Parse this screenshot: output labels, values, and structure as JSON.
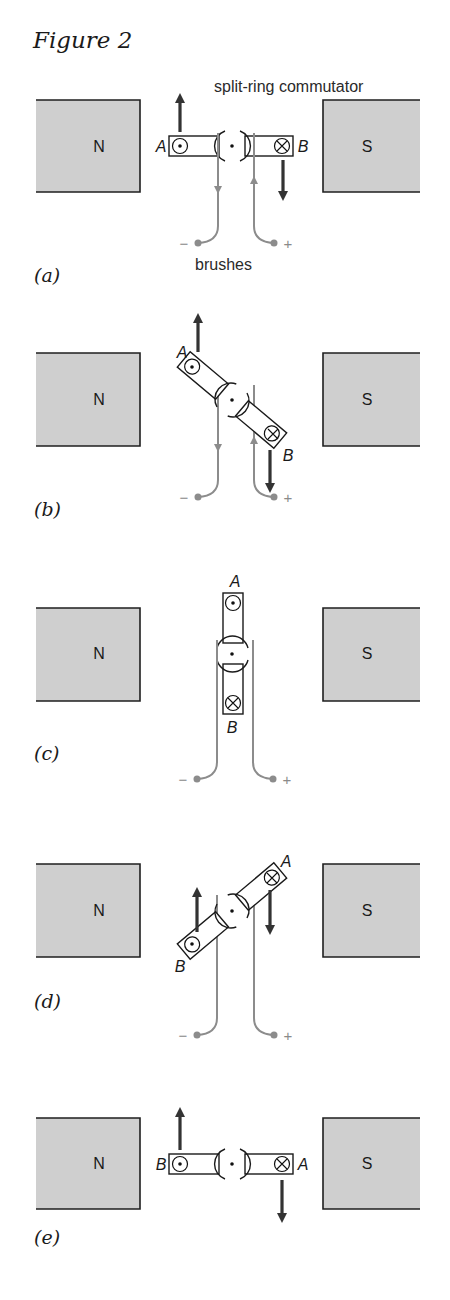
{
  "figure": {
    "title": "Figure 2",
    "annotations": {
      "commutator": "split-ring commutator",
      "brushes": "brushes"
    },
    "colors": {
      "magnet_fill": "#cfcfcf",
      "outline": "#1a1a1a",
      "brush_wire": "#8c8c8c",
      "force_arrow": "#333333"
    },
    "symbols": {
      "current_out": "dot-in-circle (current out of page)",
      "current_in": "cross-in-circle (current into page)"
    },
    "panels": [
      {
        "label": "(a)",
        "north": "N",
        "south": "S",
        "coil_angle_deg": 0,
        "side_left_label": "A",
        "side_right_label": "B",
        "left_current": "out",
        "right_current": "in",
        "force_left": "up",
        "force_right": "down",
        "brush_minus": "−",
        "brush_plus": "+"
      },
      {
        "label": "(b)",
        "north": "N",
        "south": "S",
        "coil_angle_deg": 40,
        "side_left_label": "A",
        "side_right_label": "B",
        "left_current": "out",
        "right_current": "in",
        "force_left": "up",
        "force_right": "down",
        "brush_minus": "−",
        "brush_plus": "+"
      },
      {
        "label": "(c)",
        "north": "N",
        "south": "S",
        "coil_angle_deg": 90,
        "side_top_label": "A",
        "side_bottom_label": "B",
        "top_current": "out",
        "bottom_current": "in",
        "brush_minus": "−",
        "brush_plus": "+"
      },
      {
        "label": "(d)",
        "north": "N",
        "south": "S",
        "coil_angle_deg": 140,
        "side_left_label": "B",
        "side_right_label": "A",
        "left_current": "out",
        "right_current": "in",
        "force_left": "up",
        "force_right": "down",
        "brush_minus": "−",
        "brush_plus": "+"
      },
      {
        "label": "(e)",
        "north": "N",
        "south": "S",
        "coil_angle_deg": 180,
        "side_left_label": "B",
        "side_right_label": "A",
        "left_current": "out",
        "right_current": "in",
        "force_left": "up",
        "force_right": "down"
      }
    ]
  }
}
